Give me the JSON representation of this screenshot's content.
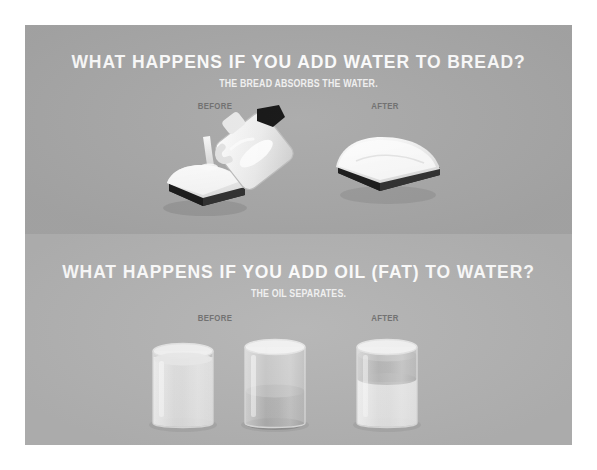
{
  "infographic": {
    "panels": [
      {
        "id": "bread",
        "title": "WHAT HAPPENS IF YOU ADD WATER TO BREAD?",
        "subtitle": "THE BREAD ABSORBS THE WATER.",
        "before_label": "BEFORE",
        "after_label": "AFTER",
        "background_color": "#a9a9a9",
        "illustrations": {
          "before": "water-jug-pouring-onto-bread-slice",
          "after": "swollen-bread-slice"
        }
      },
      {
        "id": "oil",
        "title": "WHAT HAPPENS IF YOU ADD OIL (FAT) TO WATER?",
        "subtitle": "THE OIL SEPARATES.",
        "before_label": "BEFORE",
        "after_label": "AFTER",
        "background_color": "#b4b4b4",
        "illustrations": {
          "before": "two-beakers-water-and-oil",
          "after": "beaker-with-oil-layer-on-water"
        }
      }
    ],
    "colors": {
      "title_text": "#ffffff",
      "subtitle_text": "#f2f2f2",
      "stage_label_text": "#6f6f6f",
      "bread_crust": "#2b2b2b",
      "bread_top": "#fbfbfb",
      "jug_body": "#f0f0f0",
      "jug_cap": "#111111",
      "oil_layer": "#9a9a9a",
      "water_layer": "#d8d8d8",
      "page_border": "#ffffff"
    }
  }
}
